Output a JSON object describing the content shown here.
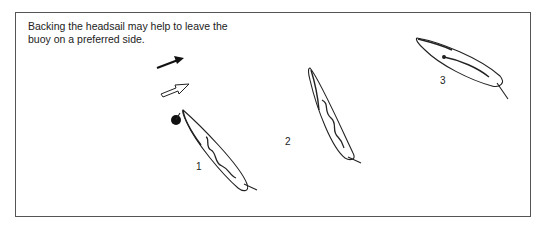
{
  "caption": {
    "line1": "Backing the headsail may help to leave the",
    "line2": "buoy on a preferred side."
  },
  "legend": {
    "wind_arrow": "solid-arrow",
    "tide_arrow": "hollow-arrow"
  },
  "boats": [
    {
      "label": "1"
    },
    {
      "label": "2"
    },
    {
      "label": "3"
    }
  ]
}
